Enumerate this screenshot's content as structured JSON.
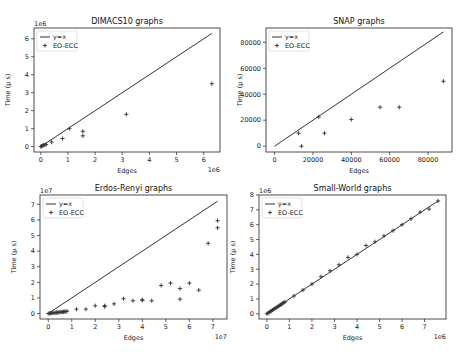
{
  "chart_data": [
    {
      "type": "scatter",
      "title": "DIMACS10 graphs",
      "xlabel": "Edges",
      "ylabel": "Time (µ s)",
      "x_offset": "1e6",
      "y_offset": "1e6",
      "xticks": [
        0,
        1,
        2,
        3,
        4,
        5,
        6
      ],
      "yticks": [
        0,
        1,
        2,
        3,
        4,
        5,
        6
      ],
      "xlim": [
        -0.25,
        6.6
      ],
      "ylim": [
        -0.3,
        6.6
      ],
      "legend": [
        "y=x",
        "EO-ECC"
      ],
      "legend_position": "upper left",
      "line": {
        "name": "y=x",
        "x": [
          0,
          6.3
        ],
        "y": [
          0,
          6.3
        ]
      },
      "series": [
        {
          "name": "EO-ECC",
          "x": [
            0.0,
            0.03,
            0.06,
            0.1,
            0.15,
            0.2,
            0.4,
            0.8,
            1.05,
            1.55,
            1.55,
            3.15,
            6.3
          ],
          "y": [
            0.0,
            0.03,
            0.05,
            0.08,
            0.1,
            0.12,
            0.25,
            0.45,
            1.0,
            0.6,
            0.85,
            1.8,
            3.5
          ]
        }
      ],
      "grid": false
    },
    {
      "type": "scatter",
      "title": "SNAP graphs",
      "xlabel": "Edges",
      "ylabel": "Time (µ s)",
      "x_offset": "",
      "y_offset": "",
      "xticks": [
        0,
        20000,
        40000,
        60000,
        80000
      ],
      "yticks": [
        0,
        20000,
        40000,
        60000,
        80000
      ],
      "xlim": [
        -4500,
        92500
      ],
      "ylim": [
        -4500,
        91000
      ],
      "legend": [
        "y=x",
        "EO-ECC"
      ],
      "legend_position": "upper left",
      "line": {
        "name": "y=x",
        "x": [
          0,
          88000
        ],
        "y": [
          0,
          88000
        ]
      },
      "series": [
        {
          "name": "EO-ECC",
          "x": [
            12500,
            14000,
            23000,
            26000,
            40000,
            55000,
            65000,
            88000
          ],
          "y": [
            10000,
            0,
            22500,
            10000,
            20500,
            30000,
            30000,
            50000
          ]
        }
      ],
      "grid": false
    },
    {
      "type": "scatter",
      "title": "Erdos-Renyi graphs",
      "xlabel": "Edges",
      "ylabel": "Time (µ s)",
      "x_offset": "1e7",
      "y_offset": "1e7",
      "xticks": [
        0,
        1,
        2,
        3,
        4,
        5,
        6,
        7
      ],
      "yticks": [
        0,
        1,
        2,
        3,
        4,
        5,
        6,
        7
      ],
      "xlim": [
        -0.35,
        7.6
      ],
      "ylim": [
        -0.35,
        7.6
      ],
      "legend": [
        "y=x",
        "EO-ECC"
      ],
      "legend_position": "upper left",
      "line": {
        "name": "y=x",
        "x": [
          0,
          7.2
        ],
        "y": [
          0,
          7.2
        ]
      },
      "series": [
        {
          "name": "EO-ECC",
          "x": [
            0.0,
            0.05,
            0.1,
            0.15,
            0.2,
            0.25,
            0.3,
            0.35,
            0.4,
            0.45,
            0.5,
            0.55,
            0.6,
            0.65,
            0.7,
            0.75,
            0.8,
            1.2,
            1.6,
            2.0,
            2.4,
            2.4,
            2.8,
            3.2,
            3.6,
            4.0,
            4.0,
            4.4,
            4.8,
            5.2,
            5.6,
            5.6,
            6.0,
            6.4,
            6.8,
            7.2,
            7.2
          ],
          "y": [
            0.0,
            0.01,
            0.02,
            0.03,
            0.04,
            0.05,
            0.05,
            0.06,
            0.07,
            0.08,
            0.09,
            0.1,
            0.1,
            0.11,
            0.12,
            0.13,
            0.15,
            0.28,
            0.28,
            0.5,
            0.45,
            0.5,
            0.62,
            0.95,
            0.82,
            0.85,
            0.88,
            0.82,
            1.8,
            1.95,
            1.6,
            0.92,
            1.95,
            1.5,
            4.5,
            5.5,
            5.95
          ]
        }
      ],
      "grid": false
    },
    {
      "type": "scatter",
      "title": "Small-World graphs",
      "xlabel": "Edges",
      "ylabel": "Time (µ s)",
      "x_offset": "1e6",
      "y_offset": "1e6",
      "xticks": [
        0,
        1,
        2,
        3,
        4,
        5,
        6,
        7
      ],
      "yticks": [
        0,
        1,
        2,
        3,
        4,
        5,
        6,
        7,
        8
      ],
      "xlim": [
        -0.35,
        7.95
      ],
      "ylim": [
        -0.35,
        8.0
      ],
      "legend": [
        "y=x",
        "EO-ECC"
      ],
      "legend_position": "upper left",
      "line": {
        "name": "y=x",
        "x": [
          0,
          7.6
        ],
        "y": [
          0,
          7.6
        ]
      },
      "series": [
        {
          "name": "EO-ECC",
          "x": [
            0.0,
            0.05,
            0.1,
            0.15,
            0.2,
            0.25,
            0.3,
            0.35,
            0.4,
            0.45,
            0.5,
            0.55,
            0.6,
            0.65,
            0.7,
            0.75,
            0.8,
            1.2,
            1.6,
            2.0,
            2.4,
            2.8,
            3.2,
            3.6,
            4.0,
            4.4,
            4.8,
            5.2,
            5.6,
            6.0,
            6.4,
            6.8,
            7.2,
            7.6
          ],
          "y": [
            0.0,
            0.05,
            0.1,
            0.15,
            0.2,
            0.25,
            0.3,
            0.35,
            0.4,
            0.45,
            0.5,
            0.55,
            0.6,
            0.65,
            0.7,
            0.75,
            0.8,
            1.2,
            1.6,
            2.0,
            2.5,
            2.9,
            3.3,
            3.8,
            4.0,
            4.6,
            4.85,
            5.25,
            5.6,
            6.0,
            6.4,
            6.85,
            7.05,
            7.6
          ]
        }
      ],
      "grid": false
    }
  ],
  "layout": {
    "panels": [
      {
        "left": 34,
        "top": 28,
        "right": 220,
        "bottom": 152
      },
      {
        "left": 266,
        "top": 28,
        "right": 452,
        "bottom": 152
      },
      {
        "left": 40,
        "top": 195,
        "right": 227,
        "bottom": 319
      },
      {
        "left": 259,
        "top": 195,
        "right": 446,
        "bottom": 319
      }
    ],
    "line_color": "#333333",
    "marker_color": "#333333"
  }
}
